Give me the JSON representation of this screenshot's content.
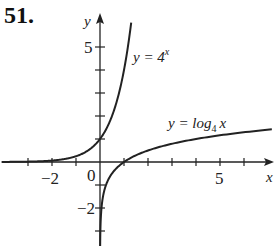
{
  "problem_number": "51.",
  "chart_data": {
    "type": "line",
    "title": "",
    "xlabel": "x",
    "ylabel": "y",
    "xlim": [
      -4,
      7.5
    ],
    "ylim": [
      -4,
      6.5
    ],
    "x_tick_labels": [
      {
        "value": -2,
        "label": "−2"
      },
      {
        "value": 0,
        "label": "0"
      },
      {
        "value": 5,
        "label": "5"
      }
    ],
    "y_tick_labels": [
      {
        "value": 5,
        "label": "5"
      },
      {
        "value": -2,
        "label": "−2"
      }
    ],
    "x_ticks": [
      -3,
      -2,
      -1,
      1,
      2,
      3,
      4,
      5,
      6
    ],
    "y_ticks": [
      -3,
      -2,
      -1,
      1,
      2,
      3,
      4,
      5
    ],
    "grid": false,
    "series": [
      {
        "name": "y = 4^x",
        "function": "4^x",
        "label_main": "y = 4",
        "label_sup": "x",
        "points": [
          [
            -4,
            0.004
          ],
          [
            -2,
            0.0625
          ],
          [
            -1,
            0.25
          ],
          [
            0,
            1
          ],
          [
            0.5,
            2
          ],
          [
            1,
            4
          ],
          [
            1.3,
            6.06
          ]
        ]
      },
      {
        "name": "y = log_4 x",
        "function": "log4(x)",
        "label_main": "y = log",
        "label_sub": "4",
        "label_var": "x",
        "points": [
          [
            0.004,
            -4
          ],
          [
            0.0625,
            -2
          ],
          [
            0.25,
            -1
          ],
          [
            1,
            0
          ],
          [
            2,
            0.5
          ],
          [
            4,
            1
          ],
          [
            7.3,
            1.43
          ]
        ]
      }
    ]
  }
}
